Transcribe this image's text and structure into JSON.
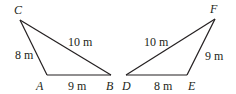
{
  "figure": {
    "type": "congruent triangles diagram",
    "triangles": [
      {
        "name": "triangle-ABC",
        "vertices": {
          "A": {
            "label": "A",
            "x": 47,
            "y": 75
          },
          "B": {
            "label": "B",
            "x": 111,
            "y": 75
          },
          "C": {
            "label": "C",
            "x": 20,
            "y": 20
          }
        },
        "sides": {
          "CA": "8 m",
          "AB": "9 m",
          "CB": "10 m"
        }
      },
      {
        "name": "triangle-DEF",
        "vertices": {
          "D": {
            "label": "D",
            "x": 126,
            "y": 75
          },
          "E": {
            "label": "E",
            "x": 187,
            "y": 75
          },
          "F": {
            "label": "F",
            "x": 215,
            "y": 19
          }
        },
        "sides": {
          "DE": "8 m",
          "EF": "9 m",
          "DF": "10 m"
        }
      }
    ]
  },
  "labels": {
    "C": "C",
    "A": "A",
    "B": "B",
    "D": "D",
    "E": "E",
    "F": "F",
    "CA": "8 m",
    "AB": "9 m",
    "CB": "10 m",
    "DE": "8 m",
    "EF": "9 m",
    "DF": "10 m"
  }
}
